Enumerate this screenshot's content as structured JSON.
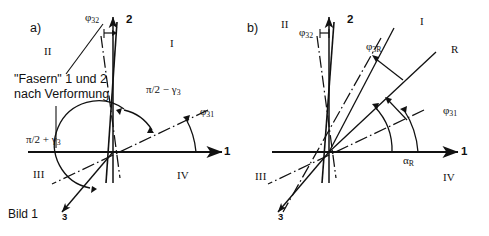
{
  "figure": {
    "caption": "Bild 1",
    "note_line1": "\"Fasern\" 1 und 2",
    "note_line2": "nach Verformung",
    "stroke_color": "#111111",
    "background_color": "#ffffff"
  },
  "panel_a": {
    "tag": "a)",
    "quadrants": [
      "I",
      "II",
      "III",
      "IV"
    ],
    "axis_labels": {
      "horizontal": "1",
      "vertical": "2",
      "fiber3": "3"
    },
    "angles": [
      {
        "name": "phi32",
        "text": "φ",
        "sub": "32"
      },
      {
        "name": "phi31",
        "text": "φ",
        "sub": "31"
      },
      {
        "name": "pi-half-minus-gamma3",
        "text": "π/2 − γ",
        "sub": "3"
      },
      {
        "name": "pi-half-plus-gamma3",
        "text": "π/2 + γ",
        "sub": "3"
      }
    ]
  },
  "panel_b": {
    "tag": "b)",
    "quadrants": [
      "I",
      "II",
      "III",
      "IV"
    ],
    "axis_labels": {
      "horizontal": "1",
      "vertical": "2",
      "fiber3": "3",
      "resultant": "R"
    },
    "angles": [
      {
        "name": "phi32",
        "text": "φ",
        "sub": "32"
      },
      {
        "name": "phi3R",
        "text": "φ",
        "sub": "3R"
      },
      {
        "name": "phi31",
        "text": "φ",
        "sub": "31"
      },
      {
        "name": "alphaR",
        "text": "α",
        "sub": "R"
      }
    ]
  }
}
